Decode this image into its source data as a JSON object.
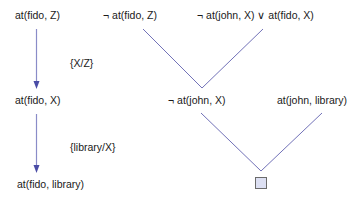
{
  "colors": {
    "arrow": "#5a5cb0",
    "resolution_line": "#7272b8",
    "text": "#1a1a1a",
    "empty_clause_fill": "#dde0f3",
    "empty_clause_border": "#6b6b6b"
  },
  "left_chain": {
    "nodes": [
      {
        "text": "at(fido, Z)"
      },
      {
        "text": "at(fido, X)"
      },
      {
        "text": "at(fido, library)"
      }
    ],
    "substitutions": [
      {
        "text": "{X/Z}"
      },
      {
        "text": "{library/X}"
      }
    ]
  },
  "resolution_tree": {
    "top_clauses": [
      {
        "text": "¬ at(fido, Z)"
      },
      {
        "text": "¬ at(john, X) ∨ at(fido, X)"
      }
    ],
    "middle_clauses": [
      {
        "text": "¬ at(john, X)"
      },
      {
        "text": "at(john, library)"
      }
    ],
    "result": {
      "label": "empty-clause",
      "symbol": "□"
    }
  }
}
